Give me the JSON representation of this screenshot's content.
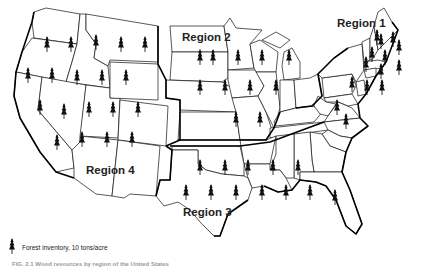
{
  "map": {
    "title": "Forest inventory by region",
    "regions": [
      {
        "label": "Region 1",
        "x": 362,
        "y": 27
      },
      {
        "label": "Region 2",
        "x": 182,
        "y": 42
      },
      {
        "label": "Region 3",
        "x": 186,
        "y": 213
      },
      {
        "label": "Region 4",
        "x": 86,
        "y": 173
      }
    ],
    "trees": [
      [
        47,
        45
      ],
      [
        71,
        45
      ],
      [
        96,
        43
      ],
      [
        121,
        45
      ],
      [
        145,
        45
      ],
      [
        28,
        76
      ],
      [
        52,
        76
      ],
      [
        77,
        78
      ],
      [
        102,
        78
      ],
      [
        126,
        78
      ],
      [
        40,
        108
      ],
      [
        64,
        112
      ],
      [
        89,
        110
      ],
      [
        113,
        110
      ],
      [
        138,
        110
      ],
      [
        57,
        143
      ],
      [
        82,
        140
      ],
      [
        107,
        140
      ],
      [
        132,
        140
      ],
      [
        200,
        58
      ],
      [
        213,
        58
      ],
      [
        238,
        58
      ],
      [
        262,
        58
      ],
      [
        289,
        58
      ],
      [
        200,
        88
      ],
      [
        225,
        88
      ],
      [
        250,
        88
      ],
      [
        276,
        88
      ],
      [
        236,
        120
      ],
      [
        260,
        120
      ],
      [
        346,
        122
      ],
      [
        377,
        38
      ],
      [
        381,
        42
      ],
      [
        393,
        40
      ],
      [
        372,
        55
      ],
      [
        385,
        58
      ],
      [
        399,
        48
      ],
      [
        366,
        65
      ],
      [
        381,
        72
      ],
      [
        399,
        68
      ],
      [
        352,
        85
      ],
      [
        367,
        88
      ],
      [
        382,
        88
      ],
      [
        337,
        108
      ],
      [
        200,
        168
      ],
      [
        225,
        168
      ],
      [
        248,
        168
      ],
      [
        273,
        168
      ],
      [
        298,
        168
      ],
      [
        186,
        193
      ],
      [
        211,
        193
      ],
      [
        236,
        193
      ],
      [
        262,
        193
      ],
      [
        286,
        193
      ],
      [
        310,
        193
      ],
      [
        335,
        198
      ]
    ]
  },
  "legend": {
    "icon": "tree-icon",
    "text": "Forest inventory, 10 tons/acre"
  },
  "caption": {
    "text": "FIG. 2.1 Wood resources by region of the United States"
  }
}
